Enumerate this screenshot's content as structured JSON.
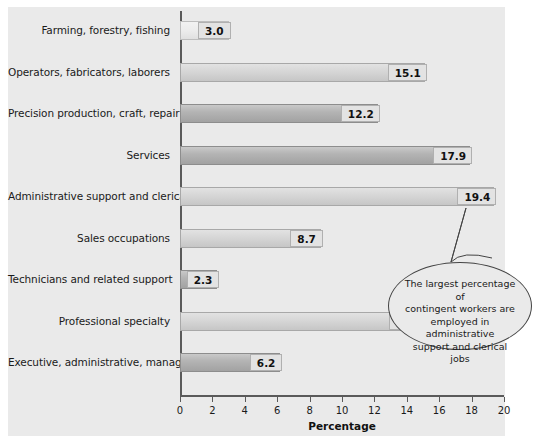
{
  "chart_data": {
    "type": "bar",
    "orientation": "horizontal",
    "title": "",
    "xlabel": "Percentage",
    "ylabel": "",
    "xlim": [
      0,
      20
    ],
    "xticks": [
      0,
      2,
      4,
      6,
      8,
      10,
      12,
      14,
      16,
      18,
      20
    ],
    "grid": false,
    "legend": null,
    "categories": [
      "Farming, forestry, fishing",
      "Operators, fabricators, laborers",
      "Precision production, craft, repair",
      "Services",
      "Administrative support and clerical",
      "Sales occupations",
      "Technicians and related support",
      "Professional specialty",
      "Executive, administrative, managerial"
    ],
    "values": [
      3.0,
      15.1,
      12.2,
      17.9,
      19.4,
      8.7,
      2.3,
      15.2,
      6.2
    ],
    "value_labels": [
      "3.0",
      "15.1",
      "12.2",
      "17.9",
      "19.4",
      "8.7",
      "2.3",
      "15.2",
      "6.2"
    ],
    "bar_shades": [
      "pale",
      "light",
      "dark",
      "dark",
      "light",
      "light",
      "dark",
      "light",
      "dark"
    ],
    "annotations": [
      {
        "target_value": 19.4,
        "target_category": "Administrative support and clerical",
        "text": "The largest percentage of contingent workers are employed in administrative support and clerical jobs",
        "lines": [
          "The largest percentage of",
          "contingent workers are",
          "employed in administrative",
          "support and clerical jobs"
        ],
        "shape": "ellipse-callout"
      }
    ],
    "colors": {
      "panel_background": "#eaeaea",
      "figure_background": "#ffffff",
      "axis": "#5a5a5a",
      "bar_dark": "#b4b4b4",
      "bar_light": "#d6d6d6",
      "bar_pale": "#ececec",
      "value_box": "#e3e3e3",
      "text": "#1a1a1a",
      "callout_border": "#444444"
    }
  }
}
